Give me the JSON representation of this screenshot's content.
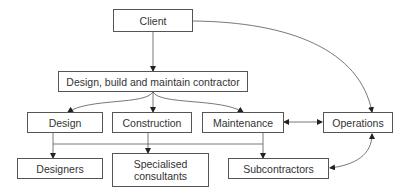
{
  "diagram": {
    "nodes": {
      "client": "Client",
      "contractor": "Design, build and maintain contractor",
      "design": "Design",
      "construction": "Construction",
      "maintenance": "Maintenance",
      "operations": "Operations",
      "designers": "Designers",
      "specialised_line1": "Specialised",
      "specialised_line2": "consultants",
      "subcontractors": "Subcontractors"
    },
    "edges": [
      {
        "from": "Client",
        "to": "Design, build and maintain contractor",
        "type": "arrow"
      },
      {
        "from": "Client",
        "to": "Operations",
        "type": "curved-arrow"
      },
      {
        "from": "Design, build and maintain contractor",
        "to": "Design",
        "type": "curved-arrow"
      },
      {
        "from": "Design, build and maintain contractor",
        "to": "Construction",
        "type": "arrow"
      },
      {
        "from": "Design, build and maintain contractor",
        "to": "Maintenance",
        "type": "curved-arrow"
      },
      {
        "from": "Maintenance",
        "to": "Operations",
        "type": "double-arrow"
      },
      {
        "from": "Operations",
        "to": "Subcontractors",
        "type": "curved-double-arrow"
      },
      {
        "from": "Design",
        "to": "Designers",
        "type": "arrow"
      },
      {
        "from": "Construction",
        "to": "Specialised consultants",
        "type": "arrow"
      },
      {
        "from": "Maintenance",
        "to": "Subcontractors",
        "type": "arrow"
      }
    ],
    "colors": {
      "line": "#555555",
      "text": "#333333"
    }
  }
}
